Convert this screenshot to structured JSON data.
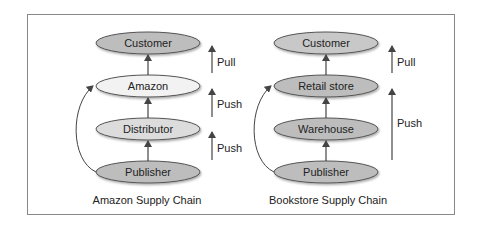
{
  "diagrams": [
    {
      "caption": "Amazon Supply Chain",
      "nodes": [
        {
          "label": "Customer",
          "fill": "#bdbdbd"
        },
        {
          "label": "Amazon",
          "fill": "#f2f2f2"
        },
        {
          "label": "Distributor",
          "fill": "#dcdcdc"
        },
        {
          "label": "Publisher",
          "fill": "#bdbdbd"
        }
      ],
      "flows": [
        {
          "label": "Pull"
        },
        {
          "label": "Push"
        },
        {
          "label": "Push"
        }
      ]
    },
    {
      "caption": "Bookstore Supply Chain",
      "nodes": [
        {
          "label": "Customer",
          "fill": "#c8c8c8"
        },
        {
          "label": "Retail store",
          "fill": "#bdbdbd"
        },
        {
          "label": "Warehouse",
          "fill": "#bdbdbd"
        },
        {
          "label": "Publisher",
          "fill": "#bdbdbd"
        }
      ],
      "flows": [
        {
          "label": "Pull"
        },
        {
          "label": "Push"
        }
      ]
    }
  ]
}
